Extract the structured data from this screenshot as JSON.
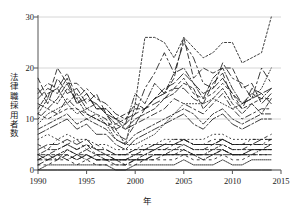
{
  "chart_data": {
    "type": "line",
    "title": "",
    "subtitle": "",
    "xlabel": "年",
    "ylabel": "法律職採用者数",
    "xlim": [
      1990,
      2015
    ],
    "ylim": [
      0,
      30
    ],
    "xticks": [
      1990,
      1995,
      2000,
      2005,
      2010,
      2015
    ],
    "xtick_labels": [
      "1990",
      "1995",
      "2000",
      "2005",
      "2010",
      "2015"
    ],
    "yticks": [
      0,
      10,
      20,
      30
    ],
    "ytick_labels": [
      "0",
      "10",
      "20",
      "30"
    ],
    "grid": "horizontal",
    "legend": "none",
    "legend_position": "none",
    "line_color": "#1a1a1a",
    "grid_color": "#cccccc",
    "axis_color": "#555555",
    "background": "#ffffff",
    "watermark_text": "",
    "x": [
      1990,
      1991,
      1992,
      1993,
      1994,
      1995,
      1996,
      1997,
      1998,
      1999,
      2000,
      2001,
      2002,
      2003,
      2004,
      2005,
      2006,
      2007,
      2008,
      2009,
      2010,
      2011,
      2012,
      2013,
      2014
    ],
    "series": [
      {
        "name": "series-01",
        "dash": "2,2",
        "values": [
          11,
          14,
          13,
          16,
          14,
          11,
          10,
          9,
          8,
          5,
          13,
          26,
          26,
          25,
          22,
          26,
          24,
          22,
          23,
          25,
          25,
          21,
          22,
          23,
          30
        ]
      },
      {
        "name": "series-02",
        "dash": "5,3",
        "values": [
          18,
          14,
          20,
          17,
          17,
          15,
          12,
          12,
          10,
          11,
          12,
          12,
          14,
          15,
          18,
          26,
          18,
          20,
          19,
          20,
          20,
          16,
          17,
          13,
          15
        ]
      },
      {
        "name": "series-03",
        "dash": "7,3,2,3",
        "values": [
          15,
          17,
          16,
          19,
          14,
          16,
          14,
          13,
          11,
          10,
          11,
          16,
          19,
          23,
          19,
          25,
          22,
          17,
          16,
          21,
          18,
          17,
          14,
          20,
          17
        ]
      },
      {
        "name": "series-04",
        "dash": "1,2",
        "values": [
          9,
          11,
          12,
          13,
          11,
          12,
          11,
          9,
          6,
          5,
          5,
          6,
          7,
          9,
          11,
          13,
          13,
          13,
          14,
          13,
          12,
          13,
          14,
          16,
          20
        ]
      },
      {
        "name": "series-05",
        "dash": "6,2,1,2",
        "values": [
          13,
          12,
          14,
          17,
          13,
          15,
          12,
          12,
          10,
          9,
          15,
          13,
          17,
          15,
          19,
          20,
          17,
          14,
          18,
          20,
          16,
          13,
          15,
          14,
          16
        ]
      },
      {
        "name": "series-06",
        "dash": "3,3",
        "values": [
          11,
          10,
          11,
          12,
          12,
          11,
          10,
          9,
          9,
          10,
          13,
          12,
          14,
          15,
          16,
          18,
          15,
          14,
          15,
          17,
          15,
          12,
          13,
          14,
          14
        ]
      },
      {
        "name": "series-07",
        "dash": "8,4",
        "values": [
          16,
          13,
          18,
          15,
          16,
          13,
          15,
          11,
          8,
          9,
          11,
          12,
          13,
          14,
          16,
          16,
          14,
          13,
          17,
          19,
          14,
          12,
          16,
          15,
          13
        ]
      },
      {
        "name": "series-08",
        "dash": "2,3,6,3",
        "values": [
          10,
          12,
          11,
          14,
          12,
          10,
          11,
          10,
          7,
          6,
          9,
          10,
          11,
          12,
          14,
          13,
          12,
          11,
          13,
          15,
          12,
          10,
          11,
          12,
          12
        ]
      },
      {
        "name": "series-09",
        "dash": "4,2",
        "values": [
          12,
          15,
          16,
          13,
          15,
          12,
          13,
          11,
          9,
          8,
          10,
          11,
          12,
          14,
          15,
          17,
          16,
          12,
          14,
          16,
          13,
          11,
          13,
          11,
          14
        ]
      },
      {
        "name": "series-10",
        "dash": "1,3",
        "values": [
          6,
          7,
          6,
          7,
          6,
          6,
          5,
          5,
          4,
          4,
          4,
          5,
          5,
          6,
          6,
          6,
          6,
          6,
          7,
          7,
          6,
          6,
          6,
          6,
          6
        ]
      },
      {
        "name": "series-11",
        "dash": "5,2,2,2",
        "values": [
          8,
          9,
          10,
          11,
          9,
          10,
          9,
          8,
          6,
          5,
          7,
          8,
          9,
          10,
          11,
          12,
          11,
          9,
          11,
          12,
          10,
          9,
          10,
          11,
          11
        ]
      },
      {
        "name": "series-12",
        "dash": "9,3",
        "values": [
          14,
          16,
          15,
          18,
          13,
          14,
          13,
          11,
          10,
          8,
          9,
          12,
          14,
          16,
          17,
          19,
          17,
          15,
          16,
          18,
          15,
          13,
          14,
          15,
          16
        ]
      },
      {
        "name": "series-13",
        "dash": "2,2,5,2",
        "values": [
          3,
          4,
          4,
          5,
          4,
          5,
          4,
          3,
          3,
          3,
          4,
          4,
          5,
          5,
          5,
          6,
          5,
          5,
          5,
          6,
          5,
          5,
          5,
          5,
          5
        ]
      },
      {
        "name": "series-14",
        "dash": "3,2",
        "values": [
          2,
          3,
          3,
          4,
          3,
          4,
          3,
          3,
          2,
          2,
          3,
          3,
          4,
          4,
          4,
          5,
          4,
          4,
          4,
          5,
          4,
          4,
          4,
          4,
          4
        ]
      },
      {
        "name": "series-15",
        "dash": "6,3",
        "values": [
          1,
          2,
          2,
          3,
          2,
          3,
          2,
          2,
          1,
          1,
          2,
          2,
          3,
          3,
          3,
          4,
          3,
          3,
          3,
          4,
          3,
          3,
          4,
          4,
          5
        ]
      },
      {
        "name": "series-16",
        "dash": "1,2,4,2",
        "values": [
          3,
          3,
          2,
          4,
          3,
          3,
          2,
          2,
          2,
          2,
          2,
          3,
          3,
          3,
          4,
          4,
          3,
          3,
          4,
          4,
          3,
          3,
          3,
          4,
          4
        ]
      },
      {
        "name": "series-17",
        "dash": "4,3",
        "values": [
          2,
          2,
          3,
          3,
          2,
          3,
          2,
          2,
          2,
          1,
          2,
          2,
          2,
          3,
          3,
          3,
          3,
          3,
          3,
          4,
          3,
          3,
          4,
          4,
          4
        ]
      },
      {
        "name": "series-18",
        "dash": "7,2",
        "values": [
          3,
          2,
          3,
          2,
          3,
          2,
          3,
          2,
          2,
          2,
          2,
          2,
          3,
          3,
          3,
          3,
          3,
          2,
          3,
          3,
          3,
          3,
          3,
          3,
          3
        ]
      },
      {
        "name": "series-19",
        "dash": "2,4",
        "values": [
          1,
          1,
          2,
          2,
          1,
          2,
          1,
          1,
          1,
          1,
          1,
          2,
          2,
          2,
          2,
          3,
          2,
          2,
          2,
          3,
          2,
          2,
          3,
          3,
          3
        ]
      },
      {
        "name": "series-20",
        "dash": "5,4,1,4",
        "values": [
          2,
          3,
          4,
          5,
          4,
          5,
          3,
          3,
          2,
          2,
          3,
          3,
          4,
          4,
          5,
          5,
          4,
          4,
          5,
          5,
          4,
          4,
          5,
          5,
          6
        ]
      },
      {
        "name": "series-21",
        "dash": "10,3",
        "values": [
          4,
          5,
          5,
          6,
          5,
          6,
          4,
          4,
          3,
          3,
          3,
          4,
          4,
          5,
          5,
          6,
          5,
          5,
          5,
          6,
          5,
          5,
          5,
          6,
          6
        ]
      },
      {
        "name": "series-22",
        "dash": "1,1",
        "values": [
          0,
          1,
          1,
          1,
          1,
          1,
          1,
          1,
          0,
          0,
          1,
          1,
          1,
          1,
          1,
          2,
          1,
          1,
          1,
          2,
          1,
          1,
          2,
          2,
          2
        ]
      },
      {
        "name": "series-23",
        "dash": "3,4,1,4",
        "values": [
          5,
          4,
          6,
          5,
          6,
          4,
          5,
          4,
          3,
          3,
          4,
          4,
          5,
          5,
          6,
          6,
          5,
          5,
          6,
          6,
          5,
          5,
          6,
          6,
          7
        ]
      },
      {
        "name": "series-24",
        "dash": "none",
        "values": [
          0,
          0,
          0,
          0,
          0,
          0,
          0,
          0,
          0,
          0,
          0,
          0,
          0,
          0,
          0,
          0,
          0,
          0,
          0,
          0,
          0,
          0,
          0,
          0,
          0
        ]
      },
      {
        "name": "series-25",
        "dash": "8,2,2,2",
        "values": [
          7,
          8,
          9,
          10,
          8,
          9,
          7,
          7,
          5,
          4,
          6,
          7,
          8,
          9,
          10,
          11,
          9,
          8,
          10,
          11,
          9,
          8,
          9,
          10,
          10
        ]
      }
    ]
  }
}
